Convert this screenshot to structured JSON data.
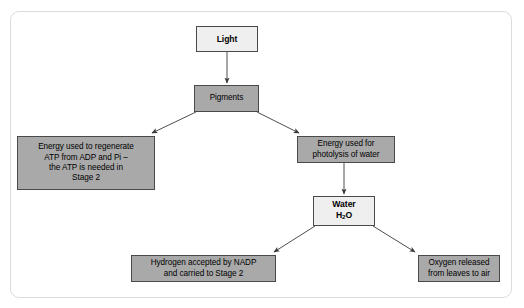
{
  "page": {
    "top_strip_text": "",
    "background_color": "#ffffff",
    "card_border_color": "#dcdcdf"
  },
  "diagram": {
    "type": "flowchart",
    "colors": {
      "node_fill_light": "#efefef",
      "node_fill_gray": "#a9a9a9",
      "node_border": "#4a4a4a",
      "connector": "#3a3a3a",
      "text": "#000000"
    },
    "nodes": [
      {
        "id": "light",
        "label": "Light",
        "fill": "#efefef",
        "bold": true,
        "lines": [
          "Light"
        ]
      },
      {
        "id": "pigments",
        "label": "Pigments",
        "fill": "#a9a9a9",
        "bold": false,
        "lines": [
          "Pigments"
        ]
      },
      {
        "id": "atp",
        "label": "Energy used to regenerate ATP from ADP and Pi – the ATP is needed in Stage 2",
        "fill": "#a9a9a9",
        "bold": false,
        "lines": [
          "Energy used to regenerate",
          "ATP from ADP and Pi –",
          "the ATP is needed in",
          "Stage 2"
        ]
      },
      {
        "id": "photolysis",
        "label": "Energy used for photolysis of water",
        "fill": "#a9a9a9",
        "bold": false,
        "lines": [
          "Energy used for",
          "photolysis of water"
        ]
      },
      {
        "id": "water",
        "label": "Water H2O",
        "fill": "#efefef",
        "bold": true,
        "lines": [
          "Water",
          "H2O"
        ]
      },
      {
        "id": "hydrogen",
        "label": "Hydrogen accepted by NADP and carried to Stage 2",
        "fill": "#a9a9a9",
        "bold": false,
        "lines": [
          "Hydrogen accepted by NADP",
          "and carried to Stage 2"
        ]
      },
      {
        "id": "oxygen",
        "label": "Oxygen released from leaves to air",
        "fill": "#a9a9a9",
        "bold": false,
        "lines": [
          "Oxygen released",
          "from leaves to air"
        ]
      }
    ],
    "edges": [
      {
        "from": "light",
        "to": "pigments",
        "style": "arrow"
      },
      {
        "from": "pigments",
        "to": "atp",
        "style": "arrow"
      },
      {
        "from": "pigments",
        "to": "photolysis",
        "style": "arrow"
      },
      {
        "from": "photolysis",
        "to": "water",
        "style": "arrow"
      },
      {
        "from": "water",
        "to": "hydrogen",
        "style": "arrow"
      },
      {
        "from": "water",
        "to": "oxygen",
        "style": "arrow"
      }
    ],
    "node_text": {
      "light_l1": "Light",
      "pigments_l1": "Pigments",
      "atp_l1": "Energy used to regenerate",
      "atp_l2": "ATP from ADP and Pi –",
      "atp_l3": "the ATP is needed in",
      "atp_l4": "Stage 2",
      "photolysis_l1": "Energy used for",
      "photolysis_l2": "photolysis of water",
      "water_l1": "Water",
      "water_l2_pre": "H",
      "water_l2_sub": "2",
      "water_l2_post": "O",
      "hydrogen_l1": "Hydrogen accepted by NADP",
      "hydrogen_l2": "and carried to Stage 2",
      "oxygen_l1": "Oxygen released",
      "oxygen_l2": "from leaves to air"
    }
  }
}
